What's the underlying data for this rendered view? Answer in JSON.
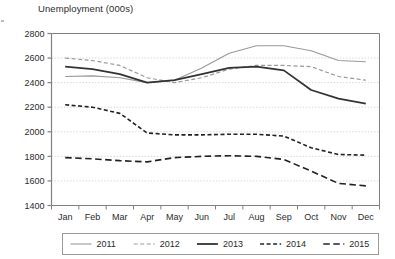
{
  "chart_data": {
    "type": "line",
    "title": "Unemployment (000s)",
    "xlabel": "",
    "ylabel": "",
    "ylim": [
      1400,
      2800
    ],
    "yticks": [
      1400,
      1600,
      1800,
      2000,
      2200,
      2400,
      2600,
      2800
    ],
    "grid": true,
    "grid_axis": "y",
    "legend_position": "bottom",
    "categories": [
      "Jan",
      "Feb",
      "Mar",
      "Apr",
      "May",
      "Jun",
      "Jul",
      "Aug",
      "Sep",
      "Oct",
      "Nov",
      "Dec"
    ],
    "series": [
      {
        "name": "2011",
        "color": "#999999",
        "style": "solid",
        "width": 1.1,
        "values": [
          2450,
          2455,
          2440,
          2400,
          2420,
          2520,
          2640,
          2700,
          2700,
          2660,
          2580,
          2570
        ]
      },
      {
        "name": "2012",
        "color": "#999999",
        "style": "dashed",
        "width": 1.2,
        "values": [
          2600,
          2580,
          2540,
          2440,
          2400,
          2440,
          2510,
          2540,
          2540,
          2530,
          2450,
          2420
        ]
      },
      {
        "name": "2013",
        "color": "#333333",
        "style": "solid",
        "width": 1.8,
        "values": [
          2530,
          2510,
          2470,
          2400,
          2420,
          2470,
          2520,
          2530,
          2500,
          2340,
          2270,
          2230
        ]
      },
      {
        "name": "2014",
        "color": "#222222",
        "style": "dashed-short",
        "width": 1.6,
        "values": [
          2220,
          2200,
          2150,
          1990,
          1975,
          1975,
          1980,
          1980,
          1965,
          1870,
          1815,
          1810
        ]
      },
      {
        "name": "2015",
        "color": "#222222",
        "style": "dashed-long",
        "width": 1.6,
        "values": [
          1790,
          1780,
          1765,
          1755,
          1790,
          1800,
          1805,
          1800,
          1775,
          1680,
          1580,
          1560
        ]
      }
    ]
  },
  "legend": {
    "items": [
      {
        "label": "2011"
      },
      {
        "label": "2012"
      },
      {
        "label": "2013"
      },
      {
        "label": "2014"
      },
      {
        "label": "2015"
      }
    ]
  },
  "axis": {
    "y_tick_labels": [
      "2800",
      "2600",
      "2400",
      "2200",
      "2000",
      "1800",
      "1600",
      "1400"
    ],
    "x_tick_labels": [
      "Jan",
      "Feb",
      "Mar",
      "Apr",
      "May",
      "Jun",
      "Jul",
      "Aug",
      "Sep",
      "Oct",
      "Nov",
      "Dec"
    ]
  },
  "colors": {
    "axis": "#808080",
    "grid": "#d9d9d9",
    "text": "#2b2b2b",
    "series_light": "#999999",
    "series_dark": "#333333"
  }
}
